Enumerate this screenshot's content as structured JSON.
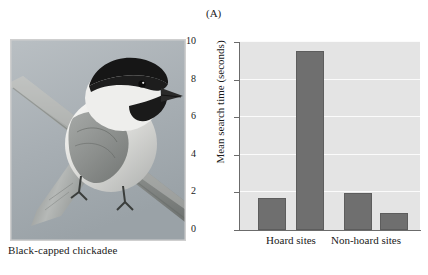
{
  "figure": {
    "photo": {
      "caption": "Black-capped chickadee",
      "alt_name": "black-capped-chickadee-photograph"
    },
    "panel_label": "(A)"
  },
  "chart_data": {
    "type": "bar",
    "title": "",
    "xlabel": "",
    "ylabel": "Mean search time (seconds)",
    "categories": [
      "Hoard sites",
      "Non-hoard sites"
    ],
    "ylim": [
      0,
      10
    ],
    "yticks": [
      "0",
      "2",
      "4",
      "6",
      "8",
      "10"
    ],
    "ytick_values": [
      0,
      2,
      4,
      6,
      8,
      10
    ],
    "grid": true,
    "legend": "none",
    "bars": [
      {
        "group": "Hoard sites",
        "index": 0,
        "value": 1.7
      },
      {
        "group": "Hoard sites",
        "index": 1,
        "value": 9.5
      },
      {
        "group": "Non-hoard sites",
        "index": 0,
        "value": 1.95
      },
      {
        "group": "Non-hoard sites",
        "index": 1,
        "value": 0.9
      }
    ],
    "series": [
      {
        "name": "bar-1",
        "values": [
          1.7,
          1.95
        ]
      },
      {
        "name": "bar-2",
        "values": [
          9.5,
          0.9
        ]
      }
    ],
    "colors": {
      "bar_fill": "#6f6f6f",
      "bar_stroke": "#5d5d5d",
      "plot_background": "#e4e4e4",
      "gridline": "#fbfbfb",
      "axis": "#6b6b6b",
      "text": "#1a1a1a"
    }
  }
}
